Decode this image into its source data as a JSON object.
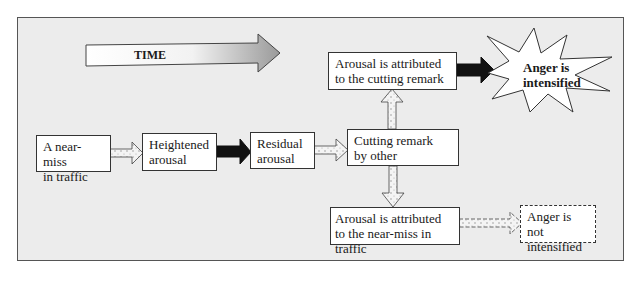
{
  "diagram": {
    "time_arrow": {
      "label": "TIME"
    },
    "nodes": {
      "near_miss": {
        "line1": "A near-miss",
        "line2": "in traffic"
      },
      "heightened": {
        "line1": "Heightened",
        "line2": "arousal"
      },
      "residual": {
        "line1": "Residual",
        "line2": "arousal"
      },
      "cutting_remark": {
        "line1": "Cutting remark",
        "line2": "by other"
      },
      "attr_remark": {
        "line1": "Arousal is attributed",
        "line2": "to the cutting remark"
      },
      "intensified": {
        "line1": "Anger is",
        "line2": "intensified"
      },
      "attr_near_miss": {
        "line1": "Arousal is attributed",
        "line2": "to the near-miss in traffic"
      },
      "not_intensified": {
        "line1": "Anger is not",
        "line2": "intensified"
      }
    },
    "edges": [
      {
        "from": "near_miss",
        "to": "heightened",
        "style": "stippled"
      },
      {
        "from": "heightened",
        "to": "residual",
        "style": "solid-black"
      },
      {
        "from": "residual",
        "to": "cutting_remark",
        "style": "stippled"
      },
      {
        "from": "cutting_remark",
        "to": "attr_remark",
        "style": "stippled"
      },
      {
        "from": "cutting_remark",
        "to": "attr_near_miss",
        "style": "stippled"
      },
      {
        "from": "attr_remark",
        "to": "intensified",
        "style": "solid-black"
      },
      {
        "from": "attr_near_miss",
        "to": "not_intensified",
        "style": "dashed-stippled"
      }
    ]
  }
}
